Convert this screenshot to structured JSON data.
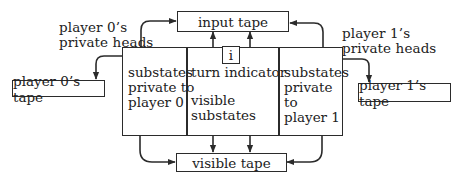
{
  "diagram": {
    "input_tape": {
      "label": "input tape"
    },
    "visible_tape": {
      "label": "visible tape"
    },
    "player0_tape": {
      "label": "player 0’s tape"
    },
    "player1_tape": {
      "label": "player 1’s tape"
    },
    "player0_heads": {
      "line1": "player 0’s",
      "line2": "private heads"
    },
    "player1_heads": {
      "line1": "player 1’s",
      "line2": "private heads"
    },
    "state_box": {
      "left_column": {
        "line1": "substates",
        "line2": "private to",
        "line3": "player 0"
      },
      "middle_column": {
        "turn_line": "turn indicator",
        "visible_line1": "visible",
        "visible_line2": "substates",
        "turn_cell_label": "i"
      },
      "right_column": {
        "line1": "substates",
        "line2": "private to",
        "line3": "player 1"
      }
    },
    "colors": {
      "line": "#2b2b2b",
      "background": "#ffffff"
    }
  }
}
